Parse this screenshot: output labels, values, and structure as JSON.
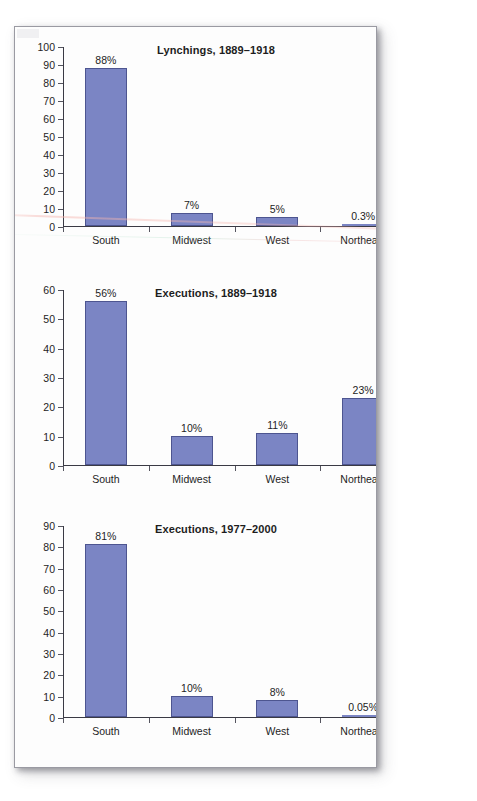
{
  "page": {
    "background_color": "#ffffff",
    "sheet_color": "#fdfdfd",
    "border_color": "#9a9aa2"
  },
  "style": {
    "bar_fill": "#7b85c4",
    "bar_stroke": "#4d5590",
    "axis_color": "#3a3a44",
    "text_color": "#1d1d1d"
  },
  "chart_data": [
    {
      "type": "bar",
      "title": "Lynchings, 1889–1918",
      "xlabel": "",
      "ylabel": "",
      "categories": [
        "South",
        "Midwest",
        "West",
        "Northeast"
      ],
      "values": [
        88,
        7,
        5,
        0.3
      ],
      "value_labels": [
        "88%",
        "7%",
        "5%",
        "0.3%"
      ],
      "ylim": [
        0,
        100
      ],
      "yticks": [
        0,
        10,
        20,
        30,
        40,
        50,
        60,
        70,
        80,
        90,
        100
      ],
      "ytick_labels": [
        "0",
        "10",
        "20",
        "30",
        "40",
        "50",
        "60",
        "70",
        "80",
        "90",
        "100"
      ],
      "grid": false,
      "legend": false
    },
    {
      "type": "bar",
      "title": "Executions, 1889–1918",
      "xlabel": "",
      "ylabel": "",
      "categories": [
        "South",
        "Midwest",
        "West",
        "Northeast"
      ],
      "values": [
        56,
        10,
        11,
        23
      ],
      "value_labels": [
        "56%",
        "10%",
        "11%",
        "23%"
      ],
      "ylim": [
        0,
        60
      ],
      "yticks": [
        0,
        10,
        20,
        30,
        40,
        50,
        60
      ],
      "ytick_labels": [
        "0",
        "10",
        "20",
        "30",
        "40",
        "50",
        "60"
      ],
      "grid": false,
      "legend": false
    },
    {
      "type": "bar",
      "title": "Executions, 1977–2000",
      "xlabel": "",
      "ylabel": "",
      "categories": [
        "South",
        "Midwest",
        "West",
        "Northeast"
      ],
      "values": [
        81,
        10,
        8,
        0.05
      ],
      "value_labels": [
        "81%",
        "10%",
        "8%",
        "0.05%"
      ],
      "ylim": [
        0,
        90
      ],
      "yticks": [
        0,
        10,
        20,
        30,
        40,
        50,
        60,
        70,
        80,
        90
      ],
      "ytick_labels": [
        "0",
        "10",
        "20",
        "30",
        "40",
        "50",
        "60",
        "70",
        "80",
        "90"
      ],
      "grid": false,
      "legend": false
    }
  ]
}
